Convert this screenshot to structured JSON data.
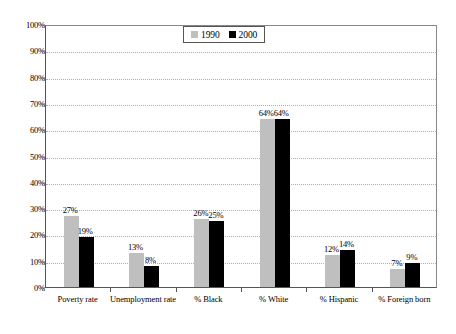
{
  "chart_data": {
    "type": "bar",
    "title": "",
    "subtitle": "",
    "xlabel": "",
    "ylabel": "",
    "ylim": [
      0,
      100
    ],
    "ytick_labels": [
      "0%",
      "10%",
      "20%",
      "30%",
      "40%",
      "50%",
      "60%",
      "70%",
      "80%",
      "90%",
      "100%"
    ],
    "ytick_values": [
      0,
      10,
      20,
      30,
      40,
      50,
      60,
      70,
      80,
      90,
      100
    ],
    "grid": true,
    "grid_axis": "y",
    "legend_position": "top-center",
    "categories": [
      "Poverty rate",
      "Unemployment rate",
      "% Black",
      "% White",
      "% Hispanic",
      "% Foreign born"
    ],
    "series": [
      {
        "name": "1990",
        "color": "#bfbfbf",
        "values": [
          27,
          13,
          26,
          64,
          12,
          7
        ],
        "data_labels": [
          "27%",
          "13%",
          "26%",
          "64%",
          "12%",
          "7%"
        ]
      },
      {
        "name": "2000",
        "color": "#000000",
        "values": [
          19,
          8,
          25,
          64,
          14,
          9
        ],
        "data_labels": [
          "19%",
          "8%",
          "25%",
          "64%",
          "14%",
          "9%"
        ]
      }
    ]
  },
  "legend": {
    "entries": [
      {
        "label": "1990",
        "swatch_color": "#bfbfbf"
      },
      {
        "label": "2000",
        "swatch_color": "#000000"
      }
    ]
  },
  "colors": {
    "axis": "#555555",
    "gridline": "#b0b0b0",
    "background": "#ffffff",
    "text": "#000000"
  }
}
